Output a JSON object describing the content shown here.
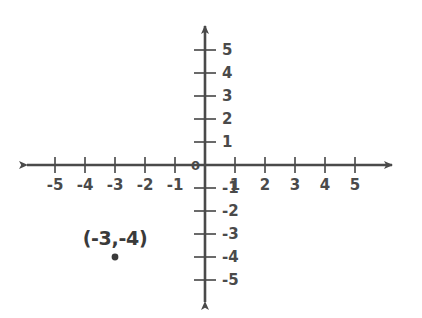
{
  "chart_data": {
    "type": "scatter",
    "title": "",
    "xlabel": "",
    "ylabel": "",
    "xlim": [
      -5.5,
      5.5
    ],
    "ylim": [
      -5.5,
      5.5
    ],
    "grid": false,
    "legend": null,
    "axis_style": "arrows-both-ends",
    "origin_label": "0",
    "x_ticks": [
      -5,
      -4,
      -3,
      -2,
      -1,
      1,
      2,
      3,
      4,
      5
    ],
    "x_tick_labels": [
      "-5",
      "-4",
      "-3",
      "-2",
      "-1",
      "1",
      "2",
      "3",
      "4",
      "5"
    ],
    "y_ticks": [
      5,
      4,
      3,
      2,
      1,
      -1,
      -2,
      -3,
      -4,
      -5
    ],
    "y_tick_labels": [
      "5",
      "4",
      "3",
      "2",
      "1",
      "-1",
      "-2",
      "-3",
      "-4",
      "-5"
    ],
    "points": [
      {
        "x": -3,
        "y": -4,
        "label": "(-3,-4)",
        "marker": "dot",
        "color": "#3a3a3a"
      }
    ],
    "colors": {
      "axis": "#4a4a4a",
      "tick": "#6a6a6a",
      "text": "#4a4a4a",
      "point": "#3a3a3a",
      "background": "#ffffff"
    }
  },
  "geometry": {
    "origin_px": {
      "x": 205,
      "y": 165
    },
    "x_step_px": 30,
    "y_step_px": 23,
    "x_axis": {
      "left_px": 27,
      "right_px": 392
    },
    "y_axis": {
      "top_px": 26,
      "bottom_px": 302
    }
  }
}
